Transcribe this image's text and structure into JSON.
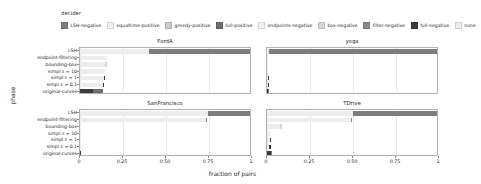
{
  "legend": {
    "title": "decider",
    "items": [
      {
        "label": "LSH-negative",
        "color": "#7d7d7d"
      },
      {
        "label": "equaltime-positive",
        "color": "#f0f0f0"
      },
      {
        "label": "greedy-positive",
        "color": "#c9c9c9"
      },
      {
        "label": "full-positive",
        "color": "#6e6e6e"
      },
      {
        "label": "endpoints-negative",
        "color": "#f2f2f2"
      },
      {
        "label": "box-negative",
        "color": "#d8d8d8"
      },
      {
        "label": "filter-negative",
        "color": "#8a8a8a"
      },
      {
        "label": "full-negative",
        "color": "#3b3b3b"
      },
      {
        "label": "none",
        "color": "#ededed"
      }
    ]
  },
  "axes": {
    "ylabel": "phase",
    "xlabel": "fraction of pairs",
    "xticks": [
      "0",
      "0.25",
      "0.50",
      "0.75",
      "1"
    ],
    "xtickvalues": [
      0,
      0.25,
      0.5,
      0.75,
      1
    ],
    "categories": [
      "LSH",
      "endpoint-filtering",
      "bounding-box",
      "simpl ε = 10",
      "simpl ε = 1",
      "simpl ε = 0.1",
      "original-curves"
    ]
  },
  "chart_data": {
    "type": "bar",
    "orientation": "horizontal",
    "stacked": true,
    "title": "",
    "xlabel": "fraction of pairs",
    "ylabel": "phase",
    "xlim": [
      0,
      1
    ],
    "grid": true,
    "legend_position": "top",
    "legend_title": "decider",
    "categories": [
      "LSH",
      "endpoint-filtering",
      "bounding-box",
      "simpl ε = 10",
      "simpl ε = 1",
      "simpl ε = 0.1",
      "original-curves"
    ],
    "series_names": [
      "LSH-negative",
      "equaltime-positive",
      "greedy-positive",
      "full-positive",
      "endpoints-negative",
      "box-negative",
      "filter-negative",
      "full-negative",
      "none"
    ],
    "panels": [
      {
        "title": "FordA",
        "rows": [
          {
            "category": "LSH",
            "segments": [
              {
                "name": "LSH-negative",
                "value": 0.0
              },
              {
                "name": "equaltime-positive",
                "value": 0.0
              },
              {
                "name": "greedy-positive",
                "value": 0.0
              },
              {
                "name": "full-positive",
                "value": 0.0
              },
              {
                "name": "endpoints-negative",
                "value": 0.0
              },
              {
                "name": "box-negative",
                "value": 0.0
              },
              {
                "name": "filter-negative",
                "value": 0.0
              },
              {
                "name": "full-negative",
                "value": 0.0
              },
              {
                "name": "none",
                "value": 0.4
              },
              {
                "name": "LSH-negative",
                "value": 0.6
              }
            ]
          },
          {
            "category": "endpoint-filtering",
            "segments": [
              {
                "name": "none",
                "value": 0.155
              },
              {
                "name": "filter-negative",
                "value": 0.0
              }
            ]
          },
          {
            "category": "bounding-box",
            "segments": [
              {
                "name": "none",
                "value": 0.145
              },
              {
                "name": "box-negative",
                "value": 0.01
              }
            ]
          },
          {
            "category": "simpl ε = 10",
            "segments": [
              {
                "name": "none",
                "value": 0.145
              }
            ]
          },
          {
            "category": "simpl ε = 1",
            "segments": [
              {
                "name": "none",
                "value": 0.14
              },
              {
                "name": "full-negative",
                "value": 0.005
              }
            ]
          },
          {
            "category": "simpl ε = 0.1",
            "segments": [
              {
                "name": "none",
                "value": 0.135
              },
              {
                "name": "full-negative",
                "value": 0.005
              }
            ]
          },
          {
            "category": "original-curves",
            "segments": [
              {
                "name": "full-negative",
                "value": 0.075
              },
              {
                "name": "full-positive",
                "value": 0.06
              }
            ]
          }
        ]
      },
      {
        "title": "yoga",
        "rows": [
          {
            "category": "LSH",
            "segments": [
              {
                "name": "none",
                "value": 0.01
              },
              {
                "name": "LSH-negative",
                "value": 0.985
              }
            ]
          },
          {
            "category": "endpoint-filtering",
            "segments": [
              {
                "name": "none",
                "value": 0.008
              }
            ]
          },
          {
            "category": "bounding-box",
            "segments": [
              {
                "name": "none",
                "value": 0.008
              }
            ]
          },
          {
            "category": "simpl ε = 10",
            "segments": [
              {
                "name": "none",
                "value": 0.007
              }
            ]
          },
          {
            "category": "simpl ε = 1",
            "segments": [
              {
                "name": "none",
                "value": 0.006
              },
              {
                "name": "full-negative",
                "value": 0.003
              }
            ]
          },
          {
            "category": "simpl ε = 0.1",
            "segments": [
              {
                "name": "none",
                "value": 0.005
              },
              {
                "name": "full-negative",
                "value": 0.003
              }
            ]
          },
          {
            "category": "original-curves",
            "segments": [
              {
                "name": "full-negative",
                "value": 0.007
              },
              {
                "name": "full-positive",
                "value": 0.004
              }
            ]
          }
        ]
      },
      {
        "title": "SanFrancisco",
        "rows": [
          {
            "category": "LSH",
            "segments": [
              {
                "name": "none",
                "value": 0.745
              },
              {
                "name": "LSH-negative",
                "value": 0.255
              }
            ]
          },
          {
            "category": "endpoint-filtering",
            "segments": [
              {
                "name": "none",
                "value": 0.735
              },
              {
                "name": "filter-negative",
                "value": 0.004
              }
            ]
          },
          {
            "category": "bounding-box",
            "segments": [
              {
                "name": "none",
                "value": 0.006
              }
            ]
          },
          {
            "category": "simpl ε = 10",
            "segments": [
              {
                "name": "none",
                "value": 0.005
              }
            ]
          },
          {
            "category": "simpl ε = 1",
            "segments": [
              {
                "name": "none",
                "value": 0.004
              }
            ]
          },
          {
            "category": "simpl ε = 0.1",
            "segments": [
              {
                "name": "none",
                "value": 0.004
              }
            ]
          },
          {
            "category": "original-curves",
            "segments": [
              {
                "name": "full-negative",
                "value": 0.004
              }
            ]
          }
        ]
      },
      {
        "title": "TDrive",
        "rows": [
          {
            "category": "LSH",
            "segments": [
              {
                "name": "none",
                "value": 0.5
              },
              {
                "name": "LSH-negative",
                "value": 0.5
              }
            ]
          },
          {
            "category": "endpoint-filtering",
            "segments": [
              {
                "name": "none",
                "value": 0.49
              },
              {
                "name": "filter-negative",
                "value": 0.005
              }
            ]
          },
          {
            "category": "bounding-box",
            "segments": [
              {
                "name": "none",
                "value": 0.075
              },
              {
                "name": "box-negative",
                "value": 0.01
              }
            ]
          },
          {
            "category": "simpl ε = 10",
            "segments": [
              {
                "name": "none",
                "value": 0.02
              }
            ]
          },
          {
            "category": "simpl ε = 1",
            "segments": [
              {
                "name": "none",
                "value": 0.015
              },
              {
                "name": "full-negative",
                "value": 0.008
              }
            ]
          },
          {
            "category": "simpl ε = 0.1",
            "segments": [
              {
                "name": "none",
                "value": 0.012
              },
              {
                "name": "full-negative",
                "value": 0.01
              }
            ]
          },
          {
            "category": "original-curves",
            "segments": [
              {
                "name": "full-negative",
                "value": 0.022
              },
              {
                "name": "full-positive",
                "value": 0.008
              }
            ]
          }
        ]
      }
    ]
  }
}
